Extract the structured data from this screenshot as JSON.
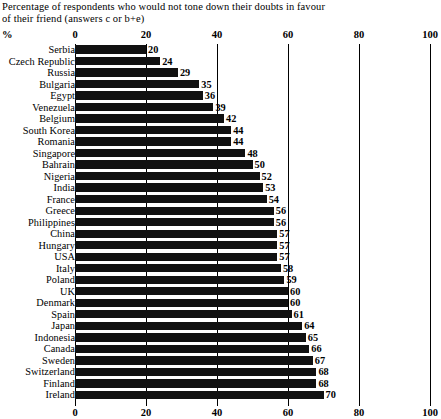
{
  "caption": {
    "line1": "Percentage of respondents who would not tone down their doubts in favour",
    "line2": "of their friend (answers c or b+e)"
  },
  "axis": {
    "unit_label": "%",
    "ticks": [
      "0",
      "20",
      "40",
      "60",
      "80",
      "100"
    ]
  },
  "chart_data": {
    "type": "bar",
    "orientation": "horizontal",
    "title": "Percentage of respondents who would not tone down their doubts in favour of their friend (answers c or b+e)",
    "xlabel": "%",
    "ylabel": "",
    "xlim": [
      0,
      100
    ],
    "xticks": [
      0,
      20,
      40,
      60,
      80,
      100
    ],
    "grid": true,
    "legend": "none",
    "categories": [
      "Serbia",
      "Czech Republic",
      "Russia",
      "Bulgaria",
      "Egypt",
      "Venezuela",
      "Belgium",
      "South Korea",
      "Romania",
      "Singapore",
      "Bahrain",
      "Nigeria",
      "India",
      "France",
      "Greece",
      "Philippines",
      "China",
      "Hungary",
      "USA",
      "Italy",
      "Poland",
      "UK",
      "Denmark",
      "Spain",
      "Japan",
      "Indonesia",
      "Canada",
      "Sweden",
      "Switzerland",
      "Finland",
      "Ireland"
    ],
    "values": [
      20,
      24,
      29,
      35,
      36,
      39,
      42,
      44,
      44,
      48,
      50,
      52,
      53,
      54,
      56,
      56,
      57,
      57,
      57,
      58,
      59,
      60,
      60,
      61,
      64,
      65,
      66,
      67,
      68,
      68,
      70
    ],
    "value_labels": [
      "20",
      "24",
      "29",
      "35",
      "36",
      "39",
      "42",
      "44",
      "44",
      "48",
      "50",
      "52",
      "53",
      "54",
      "56",
      "56",
      "57",
      "57",
      "57",
      "58",
      "59",
      "60",
      "60",
      "61",
      "64",
      "65",
      "66",
      "67",
      "68",
      "68",
      "70"
    ]
  }
}
